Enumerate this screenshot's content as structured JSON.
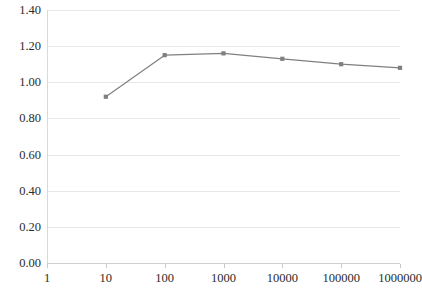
{
  "chart_data": {
    "type": "line",
    "title": "",
    "xlabel": "",
    "ylabel": "",
    "xscale": "log",
    "x": [
      10,
      100,
      1000,
      10000,
      100000,
      1000000
    ],
    "values": [
      0.92,
      1.15,
      1.16,
      1.13,
      1.1,
      1.08
    ],
    "series": [
      {
        "name": "series-1",
        "values": [
          0.92,
          1.15,
          1.16,
          1.13,
          1.1,
          1.08
        ]
      }
    ],
    "x_tick_labels": [
      "1",
      "10",
      "100",
      "1000",
      "10000",
      "100000",
      "1000000"
    ],
    "x_tick_values": [
      1,
      10,
      100,
      1000,
      10000,
      100000,
      1000000
    ],
    "y_tick_labels": [
      "0.00",
      "0.20",
      "0.40",
      "0.60",
      "0.80",
      "1.00",
      "1.20",
      "1.40"
    ],
    "y_tick_values": [
      0.0,
      0.2,
      0.4,
      0.6,
      0.8,
      1.0,
      1.2,
      1.4
    ],
    "ylim": [
      0.0,
      1.4
    ],
    "xlim": [
      1,
      1000000
    ],
    "grid": "horizontal",
    "legend": "none",
    "colors": {
      "series_line": "#808080",
      "marker": "#7f7f7f",
      "gridline": "#e8e8e8",
      "axis": "#d0d0d0",
      "tick_text": "#2b2b2b",
      "background": "#ffffff"
    },
    "marker_style": "square",
    "line_width": 1.2
  }
}
